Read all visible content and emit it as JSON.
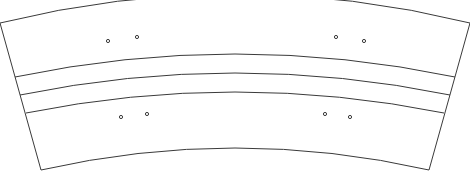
{
  "diagram": {
    "type": "curved-band-segment",
    "stroke_color": "#3a3a3a",
    "background": "#ffffff",
    "outer_arc": {
      "x1": 0,
      "y1": 23,
      "cx": 235,
      "cy": -35,
      "x2": 470,
      "y2": 23
    },
    "left_edge": {
      "x1": 0,
      "y1": 23,
      "x2": 41,
      "y2": 170
    },
    "right_edge": {
      "x1": 470,
      "y1": 23,
      "x2": 429,
      "y2": 170
    },
    "divider_arcs": [
      {
        "x1": 15,
        "y1": 77,
        "cx": 235,
        "cy": 31,
        "x2": 455,
        "y2": 77
      },
      {
        "x1": 20,
        "y1": 95,
        "cx": 235,
        "cy": 51,
        "x2": 450,
        "y2": 95
      },
      {
        "x1": 26,
        "y1": 113,
        "cx": 235,
        "cy": 71,
        "x2": 444,
        "y2": 113
      }
    ],
    "inner_arc": {
      "x1": 41,
      "y1": 170,
      "cx": 235,
      "cy": 126,
      "x2": 429,
      "y2": 170
    },
    "holes": [
      {
        "x": 108,
        "y": 41,
        "r": 1.6
      },
      {
        "x": 137,
        "y": 37,
        "r": 1.6
      },
      {
        "x": 336,
        "y": 37,
        "r": 1.6
      },
      {
        "x": 364,
        "y": 41,
        "r": 1.6
      },
      {
        "x": 121,
        "y": 117,
        "r": 1.6
      },
      {
        "x": 147,
        "y": 114,
        "r": 1.6
      },
      {
        "x": 325,
        "y": 114,
        "r": 1.6
      },
      {
        "x": 350,
        "y": 117,
        "r": 1.6
      }
    ]
  }
}
